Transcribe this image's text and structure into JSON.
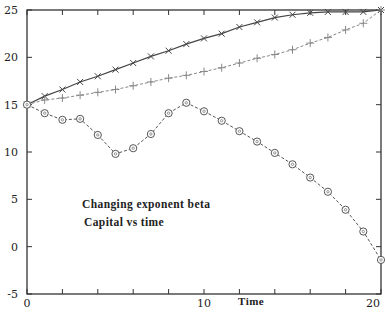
{
  "chart_data": {
    "type": "line",
    "title": "",
    "xlabel": "Time",
    "ylabel": "",
    "xlim": [
      0,
      20
    ],
    "ylim": [
      -5,
      25
    ],
    "grid": false,
    "legend": null,
    "x_tick_labels": [
      "0",
      "10",
      "20"
    ],
    "y_tick_labels": [
      "-5",
      "0",
      "5",
      "10",
      "15",
      "20",
      "25"
    ],
    "annotations": [
      "Changing exponent beta",
      "Capital vs time"
    ],
    "x": [
      0,
      1,
      2,
      3,
      4,
      5,
      6,
      7,
      8,
      9,
      10,
      11,
      12,
      13,
      14,
      15,
      16,
      17,
      18,
      19,
      20
    ],
    "series": [
      {
        "name": "x-marker series",
        "marker": "x",
        "line": "solid",
        "color": "#444444",
        "values": [
          15.0,
          15.9,
          16.6,
          17.4,
          18.0,
          18.7,
          19.4,
          20.1,
          20.7,
          21.4,
          22.0,
          22.5,
          23.2,
          23.7,
          24.2,
          24.5,
          24.7,
          24.8,
          24.8,
          24.8,
          25.0
        ]
      },
      {
        "name": "plus-marker series",
        "marker": "+",
        "line": "dashed",
        "color": "#888888",
        "values": [
          15.0,
          15.5,
          15.7,
          16.0,
          16.3,
          16.6,
          17.0,
          17.4,
          17.8,
          18.1,
          18.5,
          18.9,
          19.4,
          19.9,
          20.3,
          20.8,
          21.5,
          22.1,
          22.9,
          23.6,
          25.0
        ]
      },
      {
        "name": "circle-marker series",
        "marker": "o",
        "line": "dashed",
        "color": "#555555",
        "values": [
          15.0,
          14.1,
          13.4,
          13.5,
          11.8,
          9.8,
          10.4,
          11.9,
          14.1,
          15.2,
          14.3,
          13.3,
          12.2,
          11.1,
          9.9,
          8.7,
          7.3,
          5.8,
          3.9,
          1.6,
          -1.4
        ]
      }
    ]
  }
}
